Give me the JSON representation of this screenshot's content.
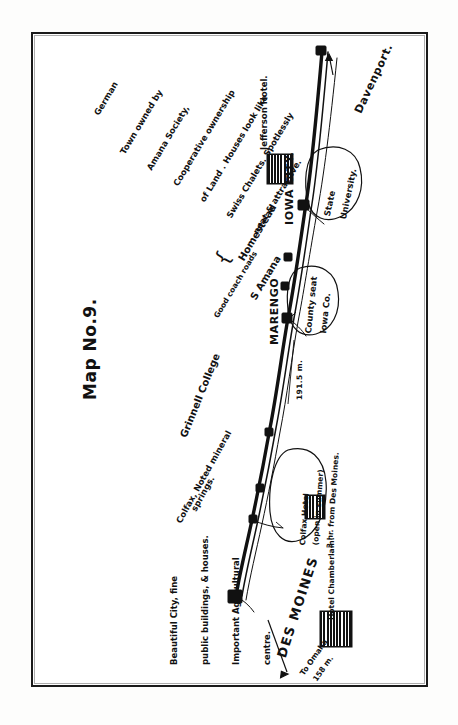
{
  "map": {
    "title": "Map No.9.",
    "type": "hand-drawn route map",
    "orientation": "text rotated 90 degrees (sideways page)",
    "route_label_distance_marengo": "191.5 m.",
    "route_label_omaha": "To Omaha",
    "route_label_omaha_distance": "158 m.",
    "terminus_arrow_label": "Davenport."
  },
  "cities": {
    "des_moines": {
      "name": "DES MOINES",
      "hotel": "Hotel Chamberlain.",
      "description_lines": [
        "Beautiful City, fine",
        "public buildings, & houses.",
        "Important Agricultural",
        "centre."
      ]
    },
    "colfax": {
      "name": "Colfax, Noted mineral",
      "name_line2": "springs.",
      "hotel": "Colfax Hotel",
      "hotel_note": "(open in summer)",
      "hotel_distance": "3 hr. from Des Moines."
    },
    "grinnell": {
      "name": "Grinnell College"
    },
    "marengo": {
      "name": "MARENGO",
      "callout_line1": "County seat",
      "callout_line2": "Iowa Co.",
      "roads": "Good coach roads"
    },
    "amana": {
      "name": "S Amana",
      "name2": "Homestead",
      "description_lines": [
        "Town owned by",
        "Amana Society,",
        "Cooperative ownership",
        "of Land . Houses look like",
        "Swiss Chalets. Spotlessly",
        "neat & attractive."
      ],
      "language": "German"
    },
    "iowa_city": {
      "name": "IOWA CITY.",
      "hotel": "Jefferson Hotel.",
      "callout_line1": "State",
      "callout_line2": "University."
    },
    "davenport": {
      "name": "Davenport."
    }
  },
  "colors": {
    "ink": "#111111",
    "paper": "#ffffff",
    "border": "#1a1a1a"
  }
}
